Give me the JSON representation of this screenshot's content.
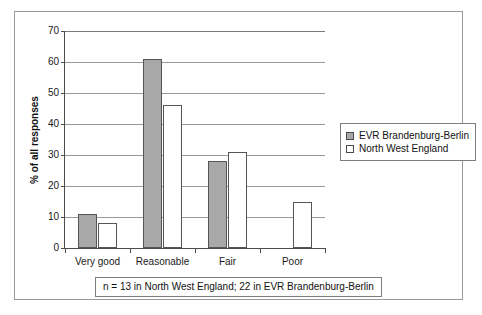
{
  "chart_data": {
    "type": "bar",
    "title": "",
    "xlabel": "",
    "ylabel": "% of all responses",
    "ylim": [
      0,
      70
    ],
    "yticks": [
      0,
      10,
      20,
      30,
      40,
      50,
      60,
      70
    ],
    "grid": true,
    "legend_position": "right",
    "categories": [
      "Very good",
      "Reasonable",
      "Fair",
      "Poor"
    ],
    "series": [
      {
        "name": "EVR Brandenburg-Berlin",
        "color": "#a8a8a8",
        "values": [
          11,
          61,
          28,
          0
        ]
      },
      {
        "name": "North West England",
        "color": "#ffffff",
        "values": [
          8,
          46,
          31,
          15
        ]
      }
    ],
    "annotation": "n = 13 in North West England; 22 in EVR Brandenburg-Berlin"
  },
  "legend": {
    "items": [
      {
        "label": "EVR Brandenburg-Berlin"
      },
      {
        "label": "North West England"
      }
    ]
  },
  "footnote": {
    "text": "n = 13 in North West England; 22 in EVR Brandenburg-Berlin"
  },
  "axis": {
    "y_title": "% of all responses"
  }
}
